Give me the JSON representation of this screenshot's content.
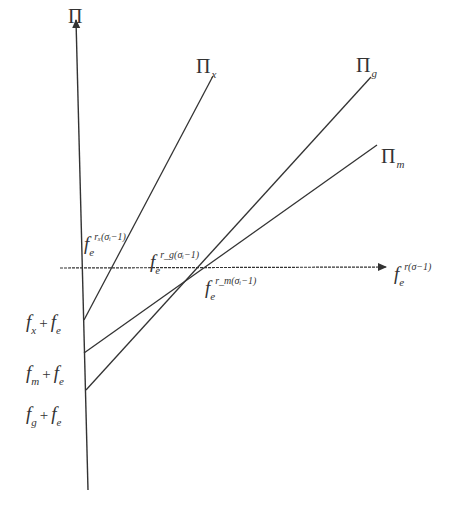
{
  "diagram": {
    "type": "profit-lines",
    "y_axis": {
      "label_symbol": "Π"
    },
    "x_axis": {
      "label_base": "f",
      "label_sub": "e",
      "label_sup": "r(σ−1)"
    },
    "lines": [
      {
        "id": "x",
        "symbol": "Π",
        "subscript": "x",
        "intercept_label": {
          "a": "f",
          "a_sub": "x",
          "plus": "+",
          "b": "f",
          "b_sub": "e"
        },
        "cutoff_label": {
          "base": "f",
          "sub": "e",
          "sup": "rₓ(σᵢ−1)"
        }
      },
      {
        "id": "g",
        "symbol": "Π",
        "subscript": "g",
        "intercept_label": {
          "a": "f",
          "a_sub": "g",
          "plus": "+",
          "b": "f",
          "b_sub": "e"
        },
        "cutoff_label": {
          "base": "f",
          "sub": "e",
          "sup": "r_g(σᵢ−1)"
        }
      },
      {
        "id": "m",
        "symbol": "Π",
        "subscript": "m",
        "intercept_label": {
          "a": "f",
          "a_sub": "m",
          "plus": "+",
          "b": "f",
          "b_sub": "e"
        },
        "cutoff_label": {
          "base": "f",
          "sub": "e",
          "sup": "r_m(σᵢ−1)"
        }
      }
    ],
    "colors": {
      "line": "#333333",
      "background": "#ffffff"
    }
  }
}
